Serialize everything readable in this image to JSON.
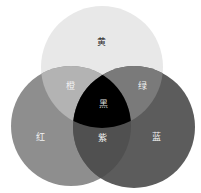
{
  "diagram": {
    "type": "venn-3",
    "circles": [
      {
        "id": "yellow",
        "label": "黄",
        "cx": 102,
        "cy": 67,
        "r": 61,
        "fill": "#e8e8e8"
      },
      {
        "id": "red",
        "label": "红",
        "cx": 71,
        "cy": 126,
        "r": 60,
        "fill": "#8e8e8e"
      },
      {
        "id": "blue",
        "label": "蓝",
        "cx": 134,
        "cy": 127,
        "r": 61,
        "fill": "#5c5c5c"
      }
    ],
    "regions": {
      "yellow_only": {
        "label": "黄",
        "x": 101,
        "y": 42,
        "color": "#333333"
      },
      "orange": {
        "label": "橙",
        "x": 70,
        "y": 86,
        "color": "#f2f2f2",
        "fill": "#b3b3b3"
      },
      "green": {
        "label": "绿",
        "x": 142,
        "y": 86,
        "color": "#f2f2f2",
        "fill": "#7a7a7a"
      },
      "black": {
        "label": "黑",
        "x": 103,
        "y": 104,
        "color": "#dddddd",
        "fill": "#000000"
      },
      "red_only": {
        "label": "红",
        "x": 40,
        "y": 137,
        "color": "#f2f2f2"
      },
      "purple": {
        "label": "紫",
        "x": 102,
        "y": 138,
        "color": "#f2f2f2",
        "fill": "#505050"
      },
      "blue_only": {
        "label": "蓝",
        "x": 156,
        "y": 137,
        "color": "#f2f2f2"
      }
    }
  }
}
